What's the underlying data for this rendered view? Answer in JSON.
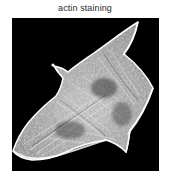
{
  "figure": {
    "title": "actin staining",
    "panel": {
      "background_color": "#000000",
      "modality": "fluorescence micrograph",
      "channel_label": "actin",
      "stain_label": "staining",
      "signal_color": "#ffffff",
      "subject": "single spread adherent cell",
      "features": [
        "bright actin cortex outlining cell periphery",
        "radial stress fibers across cell body",
        "granular punctate cytoplasmic texture",
        "filopodium at upper-left margin",
        "sharp protrusion at top-right",
        "tapering protrusion at bottom-right",
        "scalloped bright ventral edge at bottom-left"
      ]
    }
  },
  "colors": {
    "page_background": "#ffffff",
    "title_text": "#2b2b2b",
    "panel_background": "#000000",
    "fluorescence_bright": "#ffffff",
    "fluorescence_mid": "#9a9a9a",
    "fluorescence_dark": "#303030"
  }
}
